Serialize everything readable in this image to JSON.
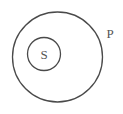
{
  "diagram": {
    "type": "euler-diagram",
    "relationship": "S is a subset of P",
    "outer_set": {
      "label": "P",
      "center": [
        57.5,
        57
      ],
      "radius": 45,
      "label_position": [
        110,
        38
      ]
    },
    "inner_set": {
      "label": "S",
      "center": [
        44,
        54
      ],
      "radius": 16.5,
      "label_position": [
        44,
        58.5
      ]
    },
    "colors": {
      "stroke": "#4a4a4a",
      "text": "#555555",
      "background": "#ffffff"
    }
  }
}
